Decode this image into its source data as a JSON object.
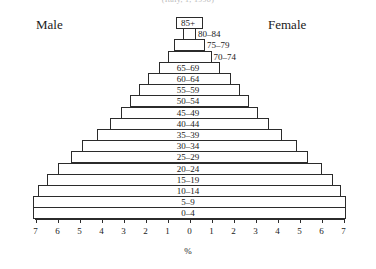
{
  "caption": "(Italy, 1, 1998)",
  "headings": {
    "male": "Male",
    "female": "Female"
  },
  "axis": {
    "title": "%",
    "tick_labels": [
      "7",
      "6",
      "5",
      "4",
      "3",
      "2",
      "1",
      "0",
      "1",
      "2",
      "3",
      "4",
      "5",
      "6",
      "7"
    ],
    "range_each_side": 7,
    "units": "%"
  },
  "chart_data": {
    "type": "bar",
    "subtype": "population-pyramid",
    "title": "(Italy, 1, 1998)",
    "xlabel": "%",
    "ylabel": "",
    "xlim": [
      -7,
      7
    ],
    "grid": false,
    "legend_position": "top",
    "orientation": "horizontal",
    "categories": [
      "85+",
      "80–84",
      "75–79",
      "70–74",
      "65–69",
      "60–64",
      "55–59",
      "50–54",
      "45–49",
      "40–44",
      "35–39",
      "30–34",
      "25–29",
      "20–24",
      "15–19",
      "10–14",
      "5–9",
      "0–4"
    ],
    "series": [
      {
        "name": "Male",
        "side": "left",
        "values": [
          0.6,
          0.3,
          0.7,
          1.0,
          1.4,
          1.9,
          2.3,
          2.7,
          3.1,
          3.6,
          4.2,
          4.9,
          5.4,
          6.0,
          6.5,
          6.9,
          7.1,
          7.1
        ]
      },
      {
        "name": "Female",
        "side": "right",
        "values": [
          0.6,
          0.3,
          0.7,
          1.0,
          1.4,
          1.9,
          2.3,
          2.7,
          3.1,
          3.6,
          4.2,
          4.9,
          5.4,
          6.0,
          6.5,
          6.9,
          7.1,
          7.1
        ]
      }
    ],
    "bars": [
      {
        "label": "85+",
        "left": 0.6,
        "right": 0.6,
        "label_pos": "center"
      },
      {
        "label": "80–84",
        "left": 0.3,
        "right": 0.3,
        "label_pos": "right"
      },
      {
        "label": "75–79",
        "left": 0.7,
        "right": 0.7,
        "label_pos": "right"
      },
      {
        "label": "70–74",
        "left": 1.0,
        "right": 1.0,
        "label_pos": "right"
      },
      {
        "label": "65–69",
        "left": 1.4,
        "right": 1.4,
        "label_pos": "center"
      },
      {
        "label": "60–64",
        "left": 1.9,
        "right": 1.9,
        "label_pos": "center"
      },
      {
        "label": "55–59",
        "left": 2.3,
        "right": 2.3,
        "label_pos": "center"
      },
      {
        "label": "50–54",
        "left": 2.7,
        "right": 2.7,
        "label_pos": "center"
      },
      {
        "label": "45–49",
        "left": 3.1,
        "right": 3.1,
        "label_pos": "center"
      },
      {
        "label": "40–44",
        "left": 3.6,
        "right": 3.6,
        "label_pos": "center"
      },
      {
        "label": "35–39",
        "left": 4.2,
        "right": 4.2,
        "label_pos": "center"
      },
      {
        "label": "30–34",
        "left": 4.9,
        "right": 4.9,
        "label_pos": "center"
      },
      {
        "label": "25–29",
        "left": 5.4,
        "right": 5.4,
        "label_pos": "center"
      },
      {
        "label": "20–24",
        "left": 6.0,
        "right": 6.0,
        "label_pos": "center"
      },
      {
        "label": "15–19",
        "left": 6.5,
        "right": 6.5,
        "label_pos": "center"
      },
      {
        "label": "10–14",
        "left": 6.9,
        "right": 6.9,
        "label_pos": "center"
      },
      {
        "label": "5–9",
        "left": 7.1,
        "right": 7.1,
        "label_pos": "center"
      },
      {
        "label": "0–4",
        "left": 7.1,
        "right": 7.1,
        "label_pos": "center"
      }
    ]
  }
}
